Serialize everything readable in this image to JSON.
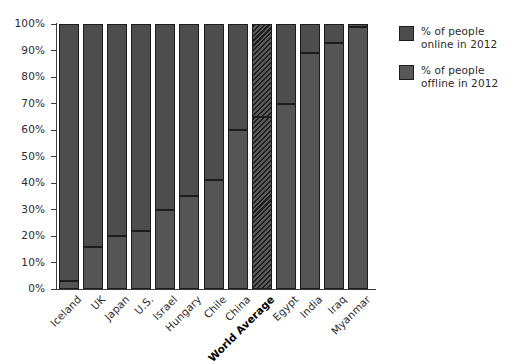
{
  "chart_data": {
    "type": "bar",
    "subtype": "stacked-100-percent",
    "title": "",
    "xlabel": "",
    "ylabel": "",
    "ylim": [
      0,
      100
    ],
    "ytick_labels": [
      "0%",
      "10%",
      "20%",
      "30%",
      "40%",
      "50%",
      "60%",
      "70%",
      "80%",
      "90%",
      "100%"
    ],
    "ytick_values": [
      0,
      10,
      20,
      30,
      40,
      50,
      60,
      70,
      80,
      90,
      100
    ],
    "grid": false,
    "legend_position": "right",
    "categories": [
      "Iceland",
      "UK",
      "Japan",
      "U.S.",
      "Israel",
      "Hungary",
      "Chile",
      "China",
      "World Average",
      "Egypt",
      "India",
      "Iraq",
      "Myanmar"
    ],
    "highlight_category": "World Average",
    "series": [
      {
        "name": "% of people online in 2012",
        "values": [
          3,
          16,
          20,
          22,
          30,
          35,
          41,
          60,
          65,
          70,
          89,
          93,
          99
        ]
      },
      {
        "name": "% of people offline in 2012",
        "values": [
          97,
          84,
          80,
          78,
          70,
          65,
          59,
          40,
          35,
          30,
          11,
          7,
          1
        ]
      }
    ]
  },
  "legend": {
    "items": [
      {
        "label_line1": "% of people",
        "label_line2": "online in 2012",
        "swatch": "online",
        "color": "#4d4d4d"
      },
      {
        "label_line1": "% of people",
        "label_line2": "offline in 2012",
        "swatch": "offline",
        "color": "#585858"
      }
    ]
  },
  "colors": {
    "online": "#4d4d4d",
    "offline": "#555555",
    "outline": "#1c1c1c",
    "axis": "#3a3a3a",
    "text": "#2b2b2b",
    "background": "#ffffff"
  }
}
